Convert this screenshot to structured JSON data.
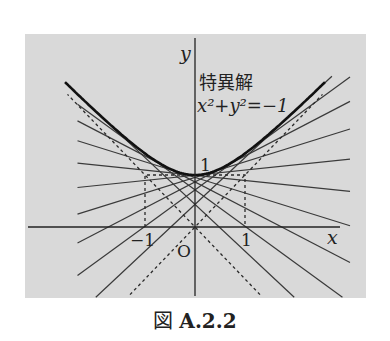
{
  "figure": {
    "caption_prefix": "図",
    "caption_number": "A.2.2",
    "axes": {
      "x_label": "x",
      "y_label": "y",
      "origin_label": "O",
      "ticks": {
        "x_neg": "−1",
        "x_pos": "1",
        "y_pos": "1"
      }
    },
    "annotation": {
      "line1": "特異解",
      "line2": "x²+y²=−1"
    },
    "colors": {
      "background": "#d9d9d9",
      "stroke": "#2a2a2a"
    }
  },
  "chart_data": {
    "type": "line",
    "xlabel": "x",
    "ylabel": "y",
    "xlim": [
      -3.4,
      3.4
    ],
    "ylim": [
      -1.4,
      3.7
    ],
    "annotations": [
      "特異解",
      "x²+y²=−1",
      "O",
      "1",
      "−1"
    ],
    "series": [
      {
        "name": "singular solution (envelope)",
        "style": "bold",
        "equation": "y = sqrt(1 + x^2)"
      },
      {
        "name": "asymptote y=x",
        "style": "dashed"
      },
      {
        "name": "asymptote y=-x",
        "style": "dashed"
      },
      {
        "name": "tangent lines y = m x + sqrt(1 - m^2)",
        "style": "solid",
        "slopes": [
          -0.9,
          -0.7,
          -0.5,
          -0.3,
          -0.1,
          0.1,
          0.3,
          0.5,
          0.7,
          0.9
        ]
      },
      {
        "name": "guide rectangle",
        "style": "dashed",
        "corners": [
          [
            -1,
            0
          ],
          [
            -1,
            1
          ],
          [
            1,
            1
          ],
          [
            1,
            0
          ]
        ]
      }
    ]
  }
}
